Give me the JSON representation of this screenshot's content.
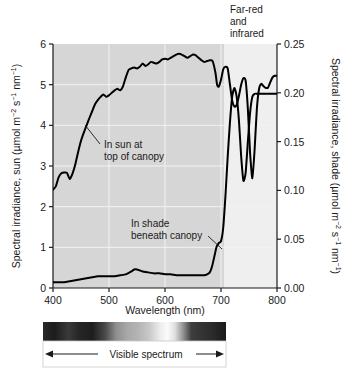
{
  "figure": {
    "background": "#ffffff",
    "plot_bg_visible": "#d6d6d6",
    "plot_bg_ir": "#efefef",
    "curve_color": "#000000",
    "gridline_color": "#f2f2f2"
  },
  "axes": {
    "x": {
      "title": "Wavelength (nm)",
      "ticks": [
        400,
        500,
        600,
        700,
        800
      ],
      "tick_labels": [
        "400",
        "500",
        "600",
        "700",
        "800"
      ],
      "range": [
        400,
        800
      ]
    },
    "y_left": {
      "title_main": "Spectral irradiance, sun (µmol m",
      "title_full": "Spectral irradiance, sun (µmol m−2 s−1 nm−1)",
      "ticks": [
        0,
        1,
        2,
        3,
        4,
        5,
        6
      ],
      "tick_labels": [
        "0",
        "1",
        "2",
        "3",
        "4",
        "5",
        "6"
      ],
      "range": [
        0,
        6
      ]
    },
    "y_right": {
      "title_full": "Spectral irradiance, shade (µmol m−2 s−1 nm−1)",
      "ticks": [
        0.0,
        0.05,
        0.1,
        0.15,
        0.2,
        0.25
      ],
      "tick_labels": [
        "0.00",
        "0.05",
        "0.10",
        "0.15",
        "0.20",
        "0.25"
      ],
      "range": [
        0,
        0.25
      ]
    }
  },
  "annotations": {
    "far_red": {
      "line1": "Far-red",
      "line2": "and",
      "line3": "infrared"
    },
    "sun_label": {
      "line1": "In sun at",
      "line2": "top of canopy"
    },
    "shade_label": {
      "line1": "In shade",
      "line2": "beneath canopy"
    },
    "spectrum_bar_label": "Visible spectrum"
  },
  "chart_data": {
    "type": "line",
    "title": "",
    "xlabel": "Wavelength (nm)",
    "ylabel": "Spectral irradiance, sun (µmol m−2 s−1 nm−1)",
    "ylabel_right": "Spectral irradiance, shade (µmol m−2 s−1 nm−1)",
    "xlim": [
      400,
      800
    ],
    "ylim": [
      0,
      6
    ],
    "ylim_right": [
      0,
      0.25
    ],
    "grid": true,
    "legend": "none",
    "shaded_region": {
      "label": "Visible spectrum",
      "from": 400,
      "to": 700
    },
    "series": [
      {
        "name": "In sun at top of canopy",
        "axis": "left",
        "x": [
          400,
          405,
          410,
          415,
          420,
          425,
          430,
          435,
          440,
          445,
          450,
          455,
          460,
          465,
          470,
          475,
          480,
          485,
          490,
          495,
          500,
          505,
          510,
          515,
          520,
          525,
          530,
          535,
          540,
          545,
          550,
          555,
          560,
          565,
          570,
          575,
          580,
          585,
          590,
          595,
          600,
          605,
          610,
          615,
          620,
          625,
          630,
          635,
          640,
          645,
          650,
          655,
          660,
          665,
          670,
          675,
          680,
          685,
          690,
          693,
          696,
          700,
          704,
          708,
          712,
          716,
          720,
          724,
          728,
          732,
          736,
          740,
          744,
          748,
          752,
          756,
          760,
          764,
          768,
          772,
          776,
          780,
          784,
          788,
          792,
          796,
          800
        ],
        "values": [
          2.42,
          2.5,
          2.72,
          2.82,
          2.84,
          2.83,
          2.68,
          2.82,
          3.05,
          3.35,
          3.62,
          3.82,
          4.0,
          4.18,
          4.35,
          4.52,
          4.62,
          4.7,
          4.76,
          4.7,
          4.74,
          4.8,
          4.86,
          4.9,
          4.86,
          4.96,
          5.18,
          5.36,
          5.4,
          5.42,
          5.4,
          5.44,
          5.52,
          5.46,
          5.5,
          5.56,
          5.54,
          5.52,
          5.56,
          5.62,
          5.64,
          5.62,
          5.66,
          5.7,
          5.74,
          5.76,
          5.74,
          5.7,
          5.66,
          5.7,
          5.74,
          5.72,
          5.66,
          5.6,
          5.56,
          5.58,
          5.6,
          5.58,
          5.3,
          5.0,
          4.95,
          5.12,
          5.38,
          5.44,
          5.4,
          5.0,
          4.6,
          4.46,
          4.5,
          4.72,
          5.0,
          5.16,
          5.1,
          4.4,
          3.3,
          2.7,
          3.4,
          4.4,
          4.9,
          5.02,
          4.96,
          4.92,
          4.93,
          5.06,
          5.18,
          5.22,
          5.22
        ]
      },
      {
        "name": "In shade beneath canopy",
        "axis": "right",
        "x": [
          400,
          410,
          420,
          430,
          440,
          450,
          460,
          470,
          480,
          490,
          500,
          510,
          520,
          530,
          540,
          545,
          550,
          555,
          560,
          570,
          580,
          590,
          600,
          610,
          620,
          630,
          640,
          650,
          660,
          665,
          670,
          675,
          680,
          684,
          688,
          692,
          696,
          700,
          704,
          708,
          712,
          716,
          720,
          724,
          728,
          732,
          736,
          740,
          744,
          748,
          752,
          756,
          760,
          764,
          768,
          772,
          776,
          780,
          784,
          788,
          792,
          796,
          800
        ],
        "values": [
          0.006,
          0.006,
          0.006,
          0.007,
          0.008,
          0.009,
          0.01,
          0.011,
          0.012,
          0.012,
          0.012,
          0.012,
          0.013,
          0.014,
          0.017,
          0.019,
          0.019,
          0.018,
          0.017,
          0.016,
          0.015,
          0.015,
          0.014,
          0.014,
          0.013,
          0.013,
          0.013,
          0.013,
          0.013,
          0.013,
          0.013,
          0.014,
          0.016,
          0.022,
          0.032,
          0.042,
          0.046,
          0.048,
          0.062,
          0.095,
          0.135,
          0.17,
          0.196,
          0.205,
          0.196,
          0.172,
          0.135,
          0.11,
          0.118,
          0.15,
          0.18,
          0.196,
          0.199,
          0.199,
          0.199,
          0.199,
          0.199,
          0.199,
          0.199,
          0.199,
          0.199,
          0.199,
          0.199
        ]
      }
    ]
  },
  "spectrum_bar": {
    "stops": [
      {
        "pos": 0,
        "color": "#2a2a2a"
      },
      {
        "pos": 6,
        "color": "#1c1c1c"
      },
      {
        "pos": 14,
        "color": "#3a3a3a"
      },
      {
        "pos": 20,
        "color": "#252525"
      },
      {
        "pos": 27,
        "color": "#1e1e1e"
      },
      {
        "pos": 34,
        "color": "#4a4a4a"
      },
      {
        "pos": 40,
        "color": "#8f8f8f"
      },
      {
        "pos": 46,
        "color": "#a8a8a8"
      },
      {
        "pos": 52,
        "color": "#b4b4b4"
      },
      {
        "pos": 58,
        "color": "#c8c8c8"
      },
      {
        "pos": 64,
        "color": "#ededed"
      },
      {
        "pos": 68,
        "color": "#fbfbfb"
      },
      {
        "pos": 72,
        "color": "#e0e0e0"
      },
      {
        "pos": 77,
        "color": "#8a8a8a"
      },
      {
        "pos": 81,
        "color": "#3e3e3e"
      },
      {
        "pos": 86,
        "color": "#353535"
      },
      {
        "pos": 92,
        "color": "#2c2c2c"
      },
      {
        "pos": 100,
        "color": "#1a1a1a"
      }
    ]
  }
}
